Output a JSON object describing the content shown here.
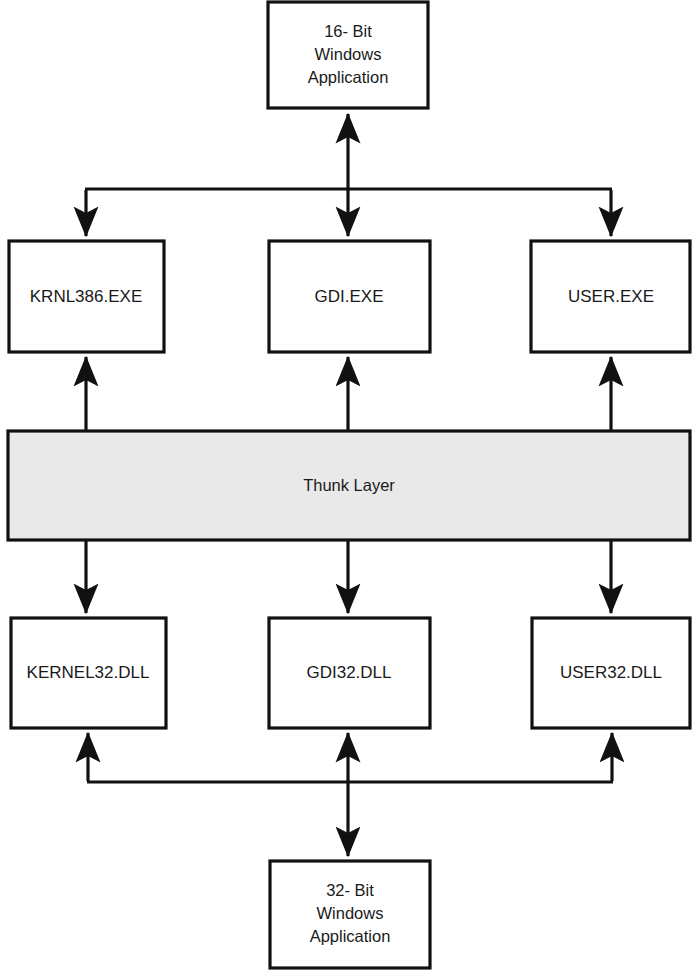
{
  "diagram": {
    "background_color": "#ffffff",
    "line_color": "#111111",
    "box_fill": "#ffffff",
    "shaded_fill": "#e9e9e9",
    "nodes": {
      "app16": {
        "id": "app16",
        "lines": [
          "16- Bit",
          "Windows",
          "Application"
        ],
        "x": 268,
        "y": 2,
        "w": 160,
        "h": 106,
        "shaded": false
      },
      "krnl386": {
        "id": "krnl386",
        "lines": [
          "KRNL386.EXE"
        ],
        "x": 9,
        "y": 241,
        "w": 155,
        "h": 111,
        "shaded": false
      },
      "gdiexe": {
        "id": "gdiexe",
        "lines": [
          "GDI.EXE"
        ],
        "x": 269,
        "y": 241,
        "w": 161,
        "h": 111,
        "shaded": false
      },
      "userexe": {
        "id": "userexe",
        "lines": [
          "USER.EXE"
        ],
        "x": 531,
        "y": 241,
        "w": 159,
        "h": 111,
        "shaded": false
      },
      "thunk": {
        "id": "thunk",
        "lines": [
          "Thunk Layer"
        ],
        "x": 8,
        "y": 431,
        "w": 682,
        "h": 109,
        "shaded": true
      },
      "kernel32": {
        "id": "kernel32",
        "lines": [
          "KERNEL32.DLL"
        ],
        "x": 11,
        "y": 618,
        "w": 155,
        "h": 110,
        "shaded": false
      },
      "gdi32": {
        "id": "gdi32",
        "lines": [
          "GDI32.DLL"
        ],
        "x": 269,
        "y": 618,
        "w": 161,
        "h": 110,
        "shaded": false
      },
      "user32": {
        "id": "user32",
        "lines": [
          "USER32.DLL"
        ],
        "x": 532,
        "y": 618,
        "w": 158,
        "h": 110,
        "shaded": false
      },
      "app32": {
        "id": "app32",
        "lines": [
          "32- Bit",
          "Windows",
          "Application"
        ],
        "x": 270,
        "y": 861,
        "w": 160,
        "h": 107,
        "shaded": false
      }
    },
    "connectors": {
      "top_bus_y": 189,
      "top_bus_left_x": 85,
      "top_bus_right_x": 612,
      "bottom_bus_y": 782,
      "bottom_bus_left_x": 87,
      "bottom_bus_right_x": 613,
      "center_x": 348,
      "left_col_x": 86,
      "right_col_x": 611
    },
    "edges": [
      {
        "name": "app16-to-bus",
        "from": "app16",
        "to": "top-bus",
        "arrows": "both"
      },
      {
        "name": "bus-to-krnl386",
        "from": "top-bus",
        "to": "krnl386",
        "arrows": "down"
      },
      {
        "name": "bus-to-gdiexe",
        "from": "top-bus",
        "to": "gdiexe",
        "arrows": "down"
      },
      {
        "name": "bus-to-userexe",
        "from": "top-bus",
        "to": "userexe",
        "arrows": "down"
      },
      {
        "name": "thunk-to-krnl386",
        "from": "thunk",
        "to": "krnl386",
        "arrows": "up"
      },
      {
        "name": "thunk-to-gdiexe",
        "from": "thunk",
        "to": "gdiexe",
        "arrows": "up"
      },
      {
        "name": "thunk-to-userexe",
        "from": "thunk",
        "to": "userexe",
        "arrows": "up"
      },
      {
        "name": "thunk-to-kernel32",
        "from": "thunk",
        "to": "kernel32",
        "arrows": "down"
      },
      {
        "name": "thunk-to-gdi32",
        "from": "thunk",
        "to": "gdi32",
        "arrows": "down"
      },
      {
        "name": "thunk-to-user32",
        "from": "thunk",
        "to": "user32",
        "arrows": "down"
      },
      {
        "name": "bottom-bus-to-kernel32",
        "from": "bottom-bus",
        "to": "kernel32",
        "arrows": "up"
      },
      {
        "name": "bottom-bus-to-gdi32",
        "from": "bottom-bus",
        "to": "gdi32",
        "arrows": "up"
      },
      {
        "name": "bottom-bus-to-user32",
        "from": "bottom-bus",
        "to": "user32",
        "arrows": "up"
      },
      {
        "name": "app32-to-bottom-bus",
        "from": "app32",
        "to": "bottom-bus",
        "arrows": "both"
      }
    ]
  }
}
